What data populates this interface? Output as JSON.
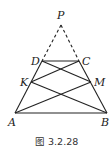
{
  "figure": {
    "caption": "图 3.2.28",
    "points": {
      "P": {
        "label": "P",
        "x": 61,
        "y": 25
      },
      "D": {
        "label": "D",
        "x": 42,
        "y": 61
      },
      "C": {
        "label": "C",
        "x": 79,
        "y": 61
      },
      "K": {
        "label": "K",
        "x": 31,
        "y": 82
      },
      "M": {
        "label": "M",
        "x": 91,
        "y": 82
      },
      "A": {
        "label": "A",
        "x": 15,
        "y": 113
      },
      "B": {
        "label": "B",
        "x": 107,
        "y": 113
      }
    },
    "solid_segments": [
      "AB",
      "DC",
      "AD",
      "BC",
      "DM",
      "CK",
      "AM",
      "BK"
    ],
    "dashed_segments": [
      "PD",
      "PC"
    ],
    "line_color": "#222222"
  }
}
